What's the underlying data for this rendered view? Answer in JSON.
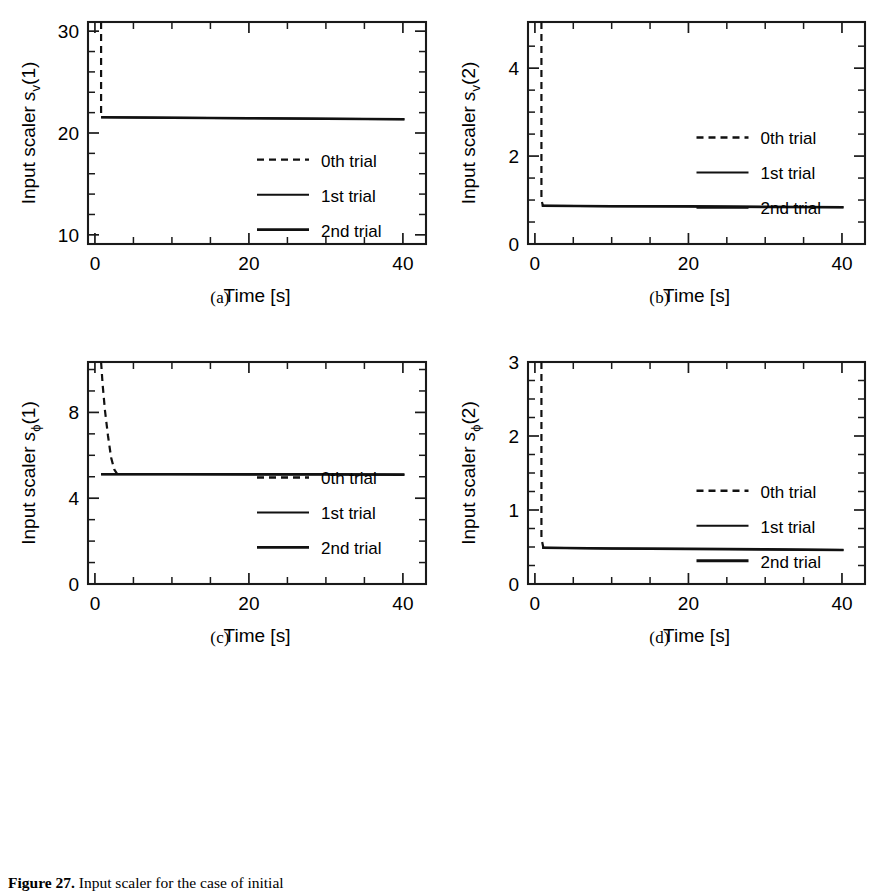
{
  "figure": {
    "caption_label": "Figure 27.",
    "caption_text": "Input scaler for the case of initial",
    "panel_letters": [
      "(a)",
      "(b)",
      "(c)",
      "(d)"
    ]
  },
  "legend": {
    "entries": [
      {
        "label": "0th trial",
        "style": "dashed"
      },
      {
        "label": "1st trial",
        "style": "solid-thin"
      },
      {
        "label": "2nd trial",
        "style": "solid-thick"
      }
    ]
  },
  "chart_data": [
    {
      "panel": "(a)",
      "type": "line",
      "title": "",
      "xlabel": "Time [s]",
      "ylabel": "Input scaler s_v(1)",
      "ylabel_parts": {
        "prefix": "Input scaler ",
        "symbol": "s",
        "subscript": "v",
        "suffix": "(1)"
      },
      "xlim": [
        -0.9,
        43.0
      ],
      "ylim": [
        9.1,
        30.9
      ],
      "xticks": [
        0,
        20,
        40
      ],
      "xticklabels": [
        "0",
        "20",
        "40"
      ],
      "xminorticks": [
        5,
        10,
        15,
        25,
        30,
        35
      ],
      "yticks": [
        10,
        20,
        30
      ],
      "yticklabels": [
        "10",
        "20",
        "30"
      ],
      "yminorticks": [
        12,
        14,
        16,
        18,
        22,
        24,
        26,
        28
      ],
      "grid": false,
      "legend_position": "center-right",
      "series": [
        {
          "name": "0th trial",
          "style": "dashed",
          "x": [
            0.8,
            0.8
          ],
          "y": [
            30.9,
            21.5
          ]
        },
        {
          "name": "1st trial",
          "style": "solid-thin",
          "x": [
            0.8,
            10,
            20,
            30,
            40.2
          ],
          "y": [
            21.55,
            21.5,
            21.45,
            21.4,
            21.35
          ]
        },
        {
          "name": "2nd trial",
          "style": "solid-thick",
          "x": [
            0.8,
            10,
            20,
            30,
            40.2
          ],
          "y": [
            21.55,
            21.5,
            21.45,
            21.4,
            21.35
          ]
        }
      ]
    },
    {
      "panel": "(b)",
      "type": "line",
      "title": "",
      "xlabel": "Time [s]",
      "ylabel": "Input scaler s_v(2)",
      "ylabel_parts": {
        "prefix": "Input scaler ",
        "symbol": "s",
        "subscript": "v",
        "suffix": "(2)"
      },
      "xlim": [
        -0.9,
        43.0
      ],
      "ylim": [
        0.0,
        5.05
      ],
      "xticks": [
        0,
        20,
        40
      ],
      "xticklabels": [
        "0",
        "20",
        "40"
      ],
      "xminorticks": [
        5,
        10,
        15,
        25,
        30,
        35
      ],
      "yticks": [
        0,
        2,
        4
      ],
      "yticklabels": [
        "0",
        "2",
        "4"
      ],
      "yminorticks": [
        0.5,
        1.0,
        1.5,
        2.5,
        3.0,
        3.5,
        4.5
      ],
      "grid": false,
      "legend_position": "center-right",
      "series": [
        {
          "name": "0th trial",
          "style": "dashed",
          "x": [
            0.85,
            0.85,
            1.05
          ],
          "y": [
            5.05,
            1.0,
            0.87
          ]
        },
        {
          "name": "1st trial",
          "style": "solid-thin",
          "x": [
            0.9,
            10,
            20,
            30,
            40.2
          ],
          "y": [
            0.87,
            0.86,
            0.855,
            0.845,
            0.835
          ]
        },
        {
          "name": "2nd trial",
          "style": "solid-thick",
          "x": [
            0.9,
            10,
            20,
            30,
            40.2
          ],
          "y": [
            0.87,
            0.86,
            0.855,
            0.845,
            0.835
          ]
        }
      ]
    },
    {
      "panel": "(c)",
      "type": "line",
      "title": "",
      "xlabel": "Time [s]",
      "ylabel": "Input scaler s_phi(1)",
      "ylabel_parts": {
        "prefix": "Input scaler ",
        "symbol": "s",
        "subscript": "ϕ",
        "suffix": "(1)"
      },
      "xlim": [
        -0.9,
        43.0
      ],
      "ylim": [
        0.0,
        10.35
      ],
      "xticks": [
        0,
        20,
        40
      ],
      "xticklabels": [
        "0",
        "20",
        "40"
      ],
      "xminorticks": [
        5,
        10,
        15,
        25,
        30,
        35
      ],
      "yticks": [
        0,
        4,
        8
      ],
      "yticklabels": [
        "0",
        "4",
        "8"
      ],
      "yminorticks": [
        1,
        2,
        3,
        5,
        6,
        7,
        9,
        10
      ],
      "grid": false,
      "legend_position": "center-right",
      "series": [
        {
          "name": "0th trial",
          "style": "dashed",
          "x": [
            0.8,
            1.0,
            1.3,
            1.7,
            2.1,
            2.5,
            2.9
          ],
          "y": [
            10.35,
            9.3,
            8.1,
            6.9,
            5.9,
            5.35,
            5.12
          ]
        },
        {
          "name": "1st trial",
          "style": "solid-thin",
          "x": [
            0.8,
            10,
            20,
            30,
            40.2
          ],
          "y": [
            5.12,
            5.12,
            5.11,
            5.11,
            5.1
          ]
        },
        {
          "name": "2nd trial",
          "style": "solid-thick",
          "x": [
            0.8,
            10,
            20,
            30,
            40.2
          ],
          "y": [
            5.12,
            5.12,
            5.11,
            5.11,
            5.1
          ]
        }
      ]
    },
    {
      "panel": "(d)",
      "type": "line",
      "title": "",
      "xlabel": "Time [s]",
      "ylabel": "Input scaler s_phi(2)",
      "ylabel_parts": {
        "prefix": "Input scaler ",
        "symbol": "s",
        "subscript": "ϕ",
        "suffix": "(2)"
      },
      "xlim": [
        -0.9,
        43.0
      ],
      "ylim": [
        0.0,
        3.0
      ],
      "xticks": [
        0,
        20,
        40
      ],
      "xticklabels": [
        "0",
        "20",
        "40"
      ],
      "xminorticks": [
        5,
        10,
        15,
        25,
        30,
        35
      ],
      "yticks": [
        0,
        1,
        2,
        3
      ],
      "yticklabels": [
        "0",
        "1",
        "2",
        "3"
      ],
      "yminorticks": [
        0.25,
        0.5,
        0.75,
        1.25,
        1.5,
        1.75,
        2.25,
        2.5,
        2.75
      ],
      "grid": false,
      "legend_position": "center-right",
      "series": [
        {
          "name": "0th trial",
          "style": "dashed",
          "x": [
            0.85,
            0.85,
            1.1
          ],
          "y": [
            3.0,
            0.62,
            0.49
          ]
        },
        {
          "name": "1st trial",
          "style": "solid-thin",
          "x": [
            0.95,
            10,
            20,
            30,
            40.2
          ],
          "y": [
            0.49,
            0.48,
            0.475,
            0.468,
            0.46
          ]
        },
        {
          "name": "2nd trial",
          "style": "solid-thick",
          "x": [
            0.95,
            10,
            20,
            30,
            40.2
          ],
          "y": [
            0.49,
            0.48,
            0.475,
            0.468,
            0.46
          ]
        }
      ]
    }
  ]
}
